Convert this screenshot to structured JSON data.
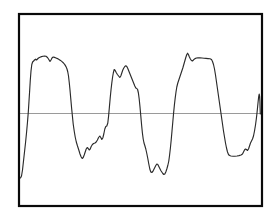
{
  "figure": {
    "title": "",
    "background_color": "#ffffff",
    "width": 275,
    "height": 218
  },
  "frame": {
    "name": "plot-border",
    "x": 19,
    "y": 14,
    "width": 243,
    "height": 192,
    "stroke_color": "#0a0a0a",
    "stroke_width": 2.2,
    "fill": "none"
  },
  "baseline": {
    "label": "zero-reference-line",
    "y": 113.5,
    "x_start": 19,
    "x_end": 262,
    "stroke_color": "#9a9a9a",
    "stroke_width": 1.1
  },
  "trace": {
    "label": "signal-trace",
    "stroke_color": "#2b2b2b",
    "stroke_width": 1.15,
    "fill": "none"
  },
  "chart_data": {
    "type": "line",
    "title": "",
    "subtitle": "",
    "xlabel": "",
    "ylabel": "",
    "legend": [],
    "legend_position": "none",
    "grid": false,
    "axis_ticks": false,
    "axis_tick_labels": [],
    "xlim": [
      19,
      262
    ],
    "ylim": [
      206,
      14
    ],
    "baseline_value": 113.5,
    "series": [
      {
        "name": "signal",
        "color": "#2b2b2b",
        "points": [
          [
            20.5,
            178.0
          ],
          [
            21.5,
            176.0
          ],
          [
            22.5,
            170.0
          ],
          [
            23.5,
            161.0
          ],
          [
            24.5,
            152.0
          ],
          [
            25.5,
            143.0
          ],
          [
            26.5,
            133.0
          ],
          [
            27.5,
            122.0
          ],
          [
            28.3,
            112.0
          ],
          [
            29.0,
            101.0
          ],
          [
            29.7,
            90.0
          ],
          [
            30.3,
            80.0
          ],
          [
            31.0,
            71.0
          ],
          [
            31.8,
            64.5
          ],
          [
            32.6,
            62.0
          ],
          [
            33.6,
            61.0
          ],
          [
            34.5,
            60.0
          ],
          [
            35.5,
            59.2
          ],
          [
            36.5,
            60.0
          ],
          [
            37.5,
            59.0
          ],
          [
            38.5,
            58.0
          ],
          [
            40.0,
            57.2
          ],
          [
            41.5,
            56.6
          ],
          [
            43.0,
            56.2
          ],
          [
            44.5,
            56.0
          ],
          [
            46.0,
            56.3
          ],
          [
            47.5,
            57.5
          ],
          [
            48.8,
            59.5
          ],
          [
            50.0,
            61.5
          ],
          [
            51.0,
            60.0
          ],
          [
            52.0,
            58.0
          ],
          [
            53.2,
            57.0
          ],
          [
            54.5,
            57.4
          ],
          [
            56.0,
            58.0
          ],
          [
            57.5,
            58.6
          ],
          [
            59.0,
            59.4
          ],
          [
            60.5,
            60.4
          ],
          [
            62.0,
            61.6
          ],
          [
            63.5,
            63.0
          ],
          [
            64.8,
            64.6
          ],
          [
            66.0,
            66.6
          ],
          [
            67.0,
            69.0
          ],
          [
            67.8,
            72.0
          ],
          [
            68.5,
            76.0
          ],
          [
            69.2,
            82.0
          ],
          [
            70.0,
            90.0
          ],
          [
            70.8,
            99.0
          ],
          [
            71.6,
            108.0
          ],
          [
            72.4,
            116.0
          ],
          [
            73.2,
            124.0
          ],
          [
            74.2,
            131.0
          ],
          [
            75.2,
            137.0
          ],
          [
            76.3,
            142.0
          ],
          [
            77.5,
            146.0
          ],
          [
            78.8,
            150.0
          ],
          [
            80.0,
            154.0
          ],
          [
            81.2,
            157.0
          ],
          [
            82.2,
            158.5
          ],
          [
            83.2,
            157.5
          ],
          [
            84.2,
            155.0
          ],
          [
            85.2,
            152.0
          ],
          [
            86.2,
            149.0
          ],
          [
            87.2,
            147.5
          ],
          [
            88.2,
            148.5
          ],
          [
            89.2,
            150.0
          ],
          [
            90.2,
            149.0
          ],
          [
            91.2,
            146.5
          ],
          [
            92.4,
            144.5
          ],
          [
            93.6,
            143.5
          ],
          [
            95.0,
            143.0
          ],
          [
            96.2,
            142.0
          ],
          [
            97.4,
            140.0
          ],
          [
            98.6,
            137.5
          ],
          [
            99.8,
            136.0
          ],
          [
            100.8,
            137.5
          ],
          [
            101.8,
            139.5
          ],
          [
            102.8,
            138.0
          ],
          [
            103.8,
            134.0
          ],
          [
            104.8,
            129.0
          ],
          [
            105.8,
            126.5
          ],
          [
            106.8,
            126.0
          ],
          [
            107.8,
            123.0
          ],
          [
            108.6,
            116.0
          ],
          [
            109.4,
            107.0
          ],
          [
            110.2,
            98.0
          ],
          [
            111.0,
            90.0
          ],
          [
            111.8,
            83.0
          ],
          [
            112.6,
            77.0
          ],
          [
            113.4,
            72.5
          ],
          [
            114.2,
            69.5
          ],
          [
            115.2,
            70.5
          ],
          [
            116.2,
            72.5
          ],
          [
            117.4,
            74.5
          ],
          [
            118.6,
            76.0
          ],
          [
            119.8,
            77.5
          ],
          [
            120.8,
            76.0
          ],
          [
            121.8,
            73.0
          ],
          [
            122.8,
            70.0
          ],
          [
            123.8,
            68.0
          ],
          [
            124.8,
            66.5
          ],
          [
            125.8,
            65.8
          ],
          [
            126.8,
            66.5
          ],
          [
            127.8,
            68.5
          ],
          [
            128.8,
            71.0
          ],
          [
            129.8,
            73.5
          ],
          [
            130.8,
            76.0
          ],
          [
            131.8,
            78.5
          ],
          [
            132.8,
            81.0
          ],
          [
            133.8,
            83.5
          ],
          [
            134.8,
            86.0
          ],
          [
            135.8,
            88.0
          ],
          [
            136.8,
            88.5
          ],
          [
            137.6,
            89.5
          ],
          [
            138.4,
            93.0
          ],
          [
            139.2,
            99.0
          ],
          [
            140.0,
            107.0
          ],
          [
            140.8,
            116.0
          ],
          [
            141.6,
            125.0
          ],
          [
            142.4,
            133.0
          ],
          [
            143.2,
            139.0
          ],
          [
            144.0,
            143.0
          ],
          [
            144.8,
            145.5
          ],
          [
            145.8,
            149.0
          ],
          [
            146.8,
            153.5
          ],
          [
            147.8,
            158.5
          ],
          [
            148.8,
            164.0
          ],
          [
            149.8,
            169.0
          ],
          [
            150.8,
            172.0
          ],
          [
            151.8,
            172.5
          ],
          [
            152.8,
            171.5
          ],
          [
            153.8,
            169.5
          ],
          [
            154.8,
            167.5
          ],
          [
            155.8,
            165.5
          ],
          [
            156.8,
            164.0
          ],
          [
            157.8,
            164.5
          ],
          [
            158.8,
            166.5
          ],
          [
            159.8,
            168.5
          ],
          [
            160.8,
            170.5
          ],
          [
            161.8,
            172.0
          ],
          [
            162.8,
            173.5
          ],
          [
            163.8,
            174.5
          ],
          [
            164.8,
            174.0
          ],
          [
            165.8,
            172.0
          ],
          [
            166.8,
            169.0
          ],
          [
            167.8,
            165.5
          ],
          [
            168.8,
            161.0
          ],
          [
            169.6,
            155.0
          ],
          [
            170.4,
            148.0
          ],
          [
            171.2,
            140.0
          ],
          [
            172.0,
            131.0
          ],
          [
            172.8,
            122.0
          ],
          [
            173.6,
            113.0
          ],
          [
            174.4,
            105.0
          ],
          [
            175.2,
            98.0
          ],
          [
            176.0,
            92.0
          ],
          [
            176.8,
            87.0
          ],
          [
            177.8,
            83.0
          ],
          [
            178.8,
            80.0
          ],
          [
            179.8,
            77.0
          ],
          [
            180.8,
            74.0
          ],
          [
            181.8,
            71.0
          ],
          [
            182.8,
            68.0
          ],
          [
            183.8,
            64.5
          ],
          [
            184.8,
            61.0
          ],
          [
            185.8,
            57.5
          ],
          [
            186.8,
            54.5
          ],
          [
            187.6,
            53.2
          ],
          [
            188.4,
            54.5
          ],
          [
            189.4,
            57.0
          ],
          [
            190.4,
            59.0
          ],
          [
            191.4,
            60.5
          ],
          [
            192.4,
            61.0
          ],
          [
            193.6,
            59.8
          ],
          [
            195.0,
            58.6
          ],
          [
            196.5,
            58.0
          ],
          [
            198.0,
            57.8
          ],
          [
            200.0,
            57.8
          ],
          [
            202.0,
            58.0
          ],
          [
            204.0,
            58.2
          ],
          [
            206.0,
            58.4
          ],
          [
            208.0,
            58.6
          ],
          [
            210.0,
            58.8
          ],
          [
            211.5,
            59.6
          ],
          [
            212.5,
            61.5
          ],
          [
            213.5,
            64.5
          ],
          [
            214.5,
            69.0
          ],
          [
            215.5,
            75.0
          ],
          [
            216.5,
            82.0
          ],
          [
            217.5,
            89.0
          ],
          [
            218.5,
            96.0
          ],
          [
            219.5,
            103.0
          ],
          [
            220.5,
            110.0
          ],
          [
            221.5,
            117.0
          ],
          [
            222.5,
            124.0
          ],
          [
            223.5,
            131.0
          ],
          [
            224.5,
            137.0
          ],
          [
            225.5,
            143.0
          ],
          [
            226.5,
            148.0
          ],
          [
            227.5,
            152.0
          ],
          [
            228.5,
            154.5
          ],
          [
            229.5,
            155.5
          ],
          [
            231.0,
            156.0
          ],
          [
            233.0,
            156.2
          ],
          [
            235.0,
            156.2
          ],
          [
            237.0,
            156.0
          ],
          [
            239.0,
            155.6
          ],
          [
            241.0,
            155.0
          ],
          [
            242.5,
            154.0
          ],
          [
            243.5,
            152.0
          ],
          [
            244.5,
            150.0
          ],
          [
            245.5,
            149.0
          ],
          [
            246.5,
            149.5
          ],
          [
            247.5,
            150.5
          ],
          [
            248.5,
            149.0
          ],
          [
            249.5,
            146.0
          ],
          [
            250.5,
            143.0
          ],
          [
            251.5,
            141.0
          ],
          [
            252.5,
            139.0
          ],
          [
            253.5,
            136.0
          ],
          [
            254.5,
            131.0
          ],
          [
            255.5,
            125.0
          ],
          [
            256.3,
            119.0
          ],
          [
            257.0,
            113.0
          ],
          [
            257.6,
            107.0
          ],
          [
            258.2,
            101.0
          ],
          [
            258.7,
            96.5
          ],
          [
            259.2,
            94.0
          ],
          [
            259.6,
            96.0
          ],
          [
            259.9,
            101.0
          ],
          [
            260.1,
            108.0
          ],
          [
            260.3,
            114.0
          ]
        ]
      }
    ]
  }
}
